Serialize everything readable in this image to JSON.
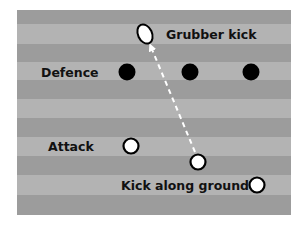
{
  "diagram": {
    "title": "Grubber kick",
    "labels": {
      "grubber": "Grubber kick",
      "defence": "Defence",
      "attack": "Attack",
      "kick_along_ground": "Kick along ground"
    },
    "colors": {
      "stripe_dark": "#9c9c9c",
      "stripe_light": "#b3b3b3",
      "defender": "#000000",
      "attacker_fill": "#ffffff",
      "attacker_stroke": "#000000",
      "kick_path": "#ffffff"
    },
    "field": {
      "x": 17,
      "y": 10,
      "width": 274,
      "height": 205
    },
    "stripes": [
      {
        "y": 10,
        "h": 14,
        "tone": "dark"
      },
      {
        "y": 24,
        "h": 20,
        "tone": "light"
      },
      {
        "y": 44,
        "h": 18,
        "tone": "dark"
      },
      {
        "y": 62,
        "h": 18,
        "tone": "light"
      },
      {
        "y": 80,
        "h": 19,
        "tone": "dark"
      },
      {
        "y": 99,
        "h": 19,
        "tone": "light"
      },
      {
        "y": 118,
        "h": 19,
        "tone": "dark"
      },
      {
        "y": 137,
        "h": 19,
        "tone": "light"
      },
      {
        "y": 156,
        "h": 19,
        "tone": "dark"
      },
      {
        "y": 175,
        "h": 20,
        "tone": "light"
      },
      {
        "y": 195,
        "h": 20,
        "tone": "dark"
      }
    ],
    "defenders": [
      {
        "cx": 127,
        "cy": 72
      },
      {
        "cx": 190,
        "cy": 72
      },
      {
        "cx": 251,
        "cy": 72
      }
    ],
    "attackers": [
      {
        "cx": 131,
        "cy": 146
      },
      {
        "cx": 198,
        "cy": 162
      },
      {
        "cx": 257,
        "cy": 185
      }
    ],
    "ball": {
      "cx": 145,
      "cy": 34,
      "rx": 7,
      "ry": 10,
      "rotate": -25
    },
    "kick_path": {
      "x1": 195,
      "y1": 152,
      "x2": 151,
      "y2": 47
    }
  }
}
